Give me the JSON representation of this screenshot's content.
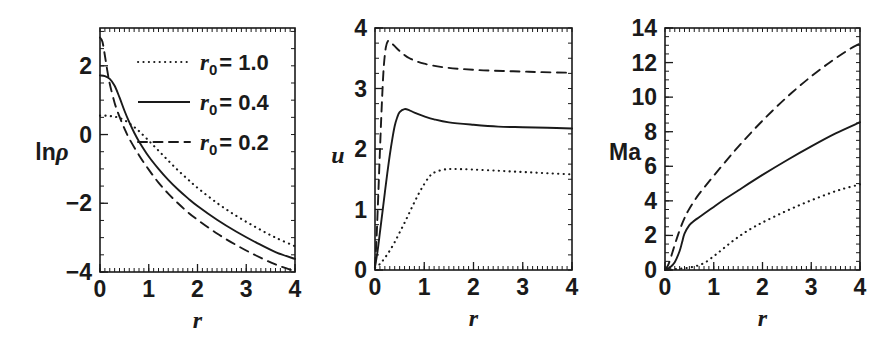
{
  "figure": {
    "background": "#ffffff",
    "ink_color": "#1a1a1a",
    "panel_count": 3
  },
  "legend": {
    "position": "top-left of first panel",
    "entries": [
      {
        "style": "dotted",
        "label_var": "r",
        "label_sub": "0",
        "label_eq": "= 1.0",
        "value": 1.0
      },
      {
        "style": "solid",
        "label_var": "r",
        "label_sub": "0",
        "label_eq": "= 0.4",
        "value": 0.4
      },
      {
        "style": "dashed",
        "label_var": "r",
        "label_sub": "0",
        "label_eq": "= 0.2",
        "value": 0.2
      }
    ]
  },
  "chart_data": [
    {
      "type": "line",
      "panel_name": "density",
      "title": "",
      "xlabel": "r",
      "ylabel": "lnρ",
      "ylabel_parts": {
        "text": "ln",
        "glyph": "ρ"
      },
      "xlim": [
        0,
        4
      ],
      "ylim": [
        -4,
        3.1
      ],
      "xticks": [
        0,
        1,
        2,
        3,
        4
      ],
      "yticks": [
        2,
        0,
        -2,
        -4
      ],
      "xtick_labels": [
        "0",
        "1",
        "2",
        "3",
        "4"
      ],
      "ytick_labels": [
        "2",
        "0",
        "-2",
        "-4"
      ],
      "grid": false,
      "minor_ticks": true,
      "legend_position": "upper-right-inside",
      "series": [
        {
          "name": "r0 = 1.0",
          "style": "dotted",
          "x": [
            0,
            0.1,
            0.2,
            0.3,
            0.4,
            0.5,
            0.6,
            0.7,
            0.8,
            1.0,
            1.2,
            1.4,
            1.6,
            1.8,
            2.0,
            2.4,
            2.8,
            3.2,
            3.6,
            4.0
          ],
          "y": [
            0.55,
            0.55,
            0.54,
            0.52,
            0.48,
            0.42,
            0.33,
            0.22,
            0.1,
            -0.18,
            -0.47,
            -0.76,
            -1.04,
            -1.3,
            -1.55,
            -1.99,
            -2.37,
            -2.7,
            -3.0,
            -3.25
          ]
        },
        {
          "name": "r0 = 0.4",
          "style": "solid",
          "x": [
            0,
            0.1,
            0.2,
            0.3,
            0.4,
            0.5,
            0.6,
            0.7,
            0.8,
            1.0,
            1.2,
            1.4,
            1.6,
            1.8,
            2.0,
            2.4,
            2.8,
            3.2,
            3.6,
            4.0
          ],
          "y": [
            1.72,
            1.7,
            1.62,
            1.42,
            1.08,
            0.7,
            0.36,
            0.06,
            -0.2,
            -0.64,
            -1.0,
            -1.32,
            -1.6,
            -1.85,
            -2.08,
            -2.48,
            -2.83,
            -3.14,
            -3.42,
            -3.62
          ]
        },
        {
          "name": "r0 = 0.2",
          "style": "dashed",
          "x": [
            0,
            0.05,
            0.1,
            0.15,
            0.2,
            0.3,
            0.4,
            0.5,
            0.6,
            0.8,
            1.0,
            1.2,
            1.4,
            1.6,
            1.8,
            2.0,
            2.4,
            2.8,
            3.2,
            3.6,
            4.0
          ],
          "y": [
            2.82,
            2.7,
            2.3,
            1.86,
            1.48,
            0.92,
            0.52,
            0.18,
            -0.12,
            -0.6,
            -1.02,
            -1.4,
            -1.72,
            -2.0,
            -2.26,
            -2.48,
            -2.88,
            -3.22,
            -3.52,
            -3.78,
            -3.98
          ]
        }
      ]
    },
    {
      "type": "line",
      "panel_name": "velocity",
      "title": "",
      "xlabel": "r",
      "ylabel": "u",
      "xlim": [
        0,
        4
      ],
      "ylim": [
        0,
        4
      ],
      "xticks": [
        0,
        1,
        2,
        3,
        4
      ],
      "yticks": [
        0,
        1,
        2,
        3,
        4
      ],
      "xtick_labels": [
        "0",
        "1",
        "2",
        "3",
        "4"
      ],
      "ytick_labels": [
        "0",
        "1",
        "2",
        "3",
        "4"
      ],
      "grid": false,
      "minor_ticks": true,
      "series": [
        {
          "name": "r0 = 1.0",
          "style": "dotted",
          "x": [
            0,
            0.1,
            0.2,
            0.3,
            0.4,
            0.5,
            0.6,
            0.7,
            0.8,
            0.9,
            1.0,
            1.1,
            1.2,
            1.4,
            1.6,
            2.0,
            2.5,
            3.0,
            3.5,
            4.0
          ],
          "y": [
            0.04,
            0.1,
            0.2,
            0.32,
            0.46,
            0.62,
            0.78,
            0.95,
            1.12,
            1.28,
            1.42,
            1.54,
            1.61,
            1.66,
            1.67,
            1.66,
            1.64,
            1.62,
            1.6,
            1.58
          ]
        },
        {
          "name": "r0 = 0.4",
          "style": "solid",
          "x": [
            0,
            0.05,
            0.1,
            0.15,
            0.2,
            0.25,
            0.3,
            0.35,
            0.4,
            0.45,
            0.5,
            0.6,
            0.7,
            0.8,
            1.0,
            1.2,
            1.5,
            2.0,
            2.5,
            3.0,
            3.5,
            4.0
          ],
          "y": [
            0.05,
            0.3,
            0.62,
            0.95,
            1.28,
            1.6,
            1.9,
            2.16,
            2.38,
            2.52,
            2.61,
            2.66,
            2.64,
            2.6,
            2.54,
            2.49,
            2.44,
            2.4,
            2.37,
            2.36,
            2.35,
            2.34
          ]
        },
        {
          "name": "r0 = 0.2",
          "style": "dashed",
          "x": [
            0,
            0.03,
            0.06,
            0.09,
            0.12,
            0.15,
            0.18,
            0.22,
            0.26,
            0.3,
            0.35,
            0.4,
            0.5,
            0.7,
            1.0,
            1.4,
            1.8,
            2.2,
            2.6,
            3.0,
            3.4,
            4.0
          ],
          "y": [
            0.06,
            0.5,
            1.1,
            1.75,
            2.38,
            2.94,
            3.38,
            3.68,
            3.78,
            3.78,
            3.74,
            3.7,
            3.62,
            3.5,
            3.41,
            3.35,
            3.32,
            3.3,
            3.29,
            3.28,
            3.27,
            3.26
          ]
        }
      ]
    },
    {
      "type": "line",
      "panel_name": "mach",
      "title": "",
      "xlabel": "r",
      "ylabel": "Ma",
      "xlim": [
        0,
        4
      ],
      "ylim": [
        0,
        14
      ],
      "xticks": [
        0,
        1,
        2,
        3,
        4
      ],
      "yticks": [
        0,
        2,
        4,
        6,
        8,
        10,
        12,
        14
      ],
      "xtick_labels": [
        "0",
        "1",
        "2",
        "3",
        "4"
      ],
      "ytick_labels": [
        "0",
        "2",
        "4",
        "6",
        "8",
        "10",
        "12",
        "14"
      ],
      "grid": false,
      "minor_ticks": true,
      "series": [
        {
          "name": "r0 = 1.0",
          "style": "dotted",
          "x": [
            0,
            0.2,
            0.4,
            0.6,
            0.8,
            1.0,
            1.2,
            1.4,
            1.6,
            1.8,
            2.0,
            2.4,
            2.8,
            3.2,
            3.6,
            4.0
          ],
          "y": [
            0.02,
            0.05,
            0.1,
            0.2,
            0.4,
            0.8,
            1.25,
            1.7,
            2.1,
            2.45,
            2.75,
            3.3,
            3.8,
            4.25,
            4.65,
            4.95
          ]
        },
        {
          "name": "r0 = 0.4",
          "style": "solid",
          "x": [
            0,
            0.1,
            0.2,
            0.3,
            0.35,
            0.4,
            0.5,
            0.6,
            0.7,
            0.8,
            1.0,
            1.2,
            1.5,
            2.0,
            2.5,
            3.0,
            3.5,
            4.0
          ],
          "y": [
            0.03,
            0.15,
            0.45,
            1.1,
            1.6,
            2.1,
            2.6,
            2.85,
            3.05,
            3.25,
            3.65,
            4.05,
            4.6,
            5.5,
            6.35,
            7.15,
            7.9,
            8.55
          ]
        },
        {
          "name": "r0 = 0.2",
          "style": "dashed",
          "x": [
            0,
            0.05,
            0.1,
            0.15,
            0.2,
            0.3,
            0.4,
            0.5,
            0.7,
            1.0,
            1.4,
            1.8,
            2.2,
            2.6,
            3.0,
            3.4,
            3.8,
            4.0
          ],
          "y": [
            0.03,
            0.2,
            0.55,
            1.0,
            1.45,
            2.3,
            3.0,
            3.55,
            4.4,
            5.45,
            6.8,
            8.05,
            9.2,
            10.25,
            11.2,
            12.05,
            12.8,
            13.1
          ]
        }
      ]
    }
  ]
}
